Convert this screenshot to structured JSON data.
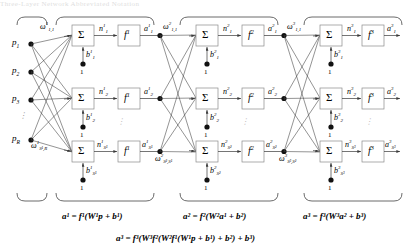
{
  "figure": {
    "title_strip": "Three-Layer Network Abbreviated Notation",
    "type": "neural-network-diagram",
    "layers": 3
  },
  "inputs": {
    "nodes": [
      "p",
      "p",
      "p",
      "p"
    ],
    "labels": [
      {
        "base": "p",
        "sub": "1"
      },
      {
        "base": "p",
        "sub": "2"
      },
      {
        "base": "p",
        "sub": "3"
      },
      {
        "base": "p",
        "sub": "R"
      }
    ],
    "vdots": "⋮"
  },
  "layer1": {
    "weight_first": {
      "base": "ω",
      "sup": "1",
      "sub": "1,1"
    },
    "weight_last": {
      "base": "ω",
      "sup": "1",
      "sub": "S¹,R"
    },
    "sum_symbol": "Σ",
    "transfer": {
      "base": "f",
      "sup": "1"
    },
    "net_inputs": [
      {
        "base": "n",
        "sup": "1",
        "sub": "1"
      },
      {
        "base": "n",
        "sup": "1",
        "sub": "2"
      },
      {
        "base": "n",
        "sup": "1",
        "sub": "S¹"
      }
    ],
    "outputs": [
      {
        "base": "a",
        "sup": "1",
        "sub": "1"
      },
      {
        "base": "a",
        "sup": "1",
        "sub": "2"
      },
      {
        "base": "a",
        "sup": "1",
        "sub": "S¹"
      }
    ],
    "biases": [
      {
        "base": "b",
        "sup": "1",
        "sub": "1"
      },
      {
        "base": "b",
        "sup": "1",
        "sub": "2"
      },
      {
        "base": "b",
        "sup": "1",
        "sub": "S¹"
      }
    ],
    "bias_source": "1"
  },
  "layer2": {
    "weight_first": {
      "base": "ω",
      "sup": "2",
      "sub": "1,1"
    },
    "weight_last": {
      "base": "ω",
      "sup": "2",
      "sub": "S²,S¹"
    },
    "sum_symbol": "Σ",
    "transfer": {
      "base": "f",
      "sup": "2"
    },
    "net_inputs": [
      {
        "base": "n",
        "sup": "2",
        "sub": "1"
      },
      {
        "base": "n",
        "sup": "2",
        "sub": "2"
      },
      {
        "base": "n",
        "sup": "2",
        "sub": "S²"
      }
    ],
    "outputs": [
      {
        "base": "a",
        "sup": "2",
        "sub": "1"
      },
      {
        "base": "a",
        "sup": "2",
        "sub": "2"
      },
      {
        "base": "a",
        "sup": "2",
        "sub": "S²"
      }
    ],
    "biases": [
      {
        "base": "b",
        "sup": "2",
        "sub": "1"
      },
      {
        "base": "b",
        "sup": "2",
        "sub": "2"
      },
      {
        "base": "b",
        "sup": "2",
        "sub": "S²"
      }
    ],
    "bias_source": "1"
  },
  "layer3": {
    "weight_first": {
      "base": "ω",
      "sup": "3",
      "sub": "1,1"
    },
    "weight_last": {
      "base": "ω",
      "sup": "3",
      "sub": "S³,S²"
    },
    "sum_symbol": "Σ",
    "transfer": {
      "base": "f",
      "sup": "3"
    },
    "net_inputs": [
      {
        "base": "n",
        "sup": "3",
        "sub": "1"
      },
      {
        "base": "n",
        "sup": "3",
        "sub": "2"
      },
      {
        "base": "n",
        "sup": "3",
        "sub": "S³"
      }
    ],
    "outputs": [
      {
        "base": "a",
        "sup": "3",
        "sub": "1"
      },
      {
        "base": "a",
        "sup": "3",
        "sub": "2"
      },
      {
        "base": "a",
        "sup": "3",
        "sub": "S³"
      }
    ],
    "biases": [
      {
        "base": "b",
        "sup": "3",
        "sub": "1"
      },
      {
        "base": "b",
        "sup": "3",
        "sub": "2"
      },
      {
        "base": "b",
        "sup": "3",
        "sub": "S³"
      }
    ],
    "bias_source": "1"
  },
  "equations": {
    "layer1": "a¹ = f¹(W¹p + b¹)",
    "layer2": "a² = f²(W²a¹ + b²)",
    "layer3": "a³ = f³(W³a² + b³)",
    "full": "a³ = f³(W³f²(W²f¹(W¹p + b¹) + b²) + b³)"
  },
  "colors": {
    "stroke": "#3a3a3a",
    "box_border": "#8a8a8a",
    "text": "#000000",
    "background": "#ffffff"
  }
}
